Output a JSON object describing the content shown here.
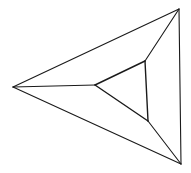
{
  "diagram": {
    "type": "graph",
    "stroke_color": "#1a1a1a",
    "background": "#ffffff",
    "vertices": {
      "outer_left": [
        13,
        87
      ],
      "outer_top": [
        179,
        9
      ],
      "outer_bottom": [
        181,
        164
      ],
      "inner_left": [
        95,
        85
      ],
      "inner_top": [
        145,
        61
      ],
      "inner_bottom": [
        148,
        121
      ]
    },
    "edges": [
      {
        "id": "outer-left-top",
        "from": "outer_left",
        "to": "outer_top",
        "kind": "outer"
      },
      {
        "id": "outer-top-bottom",
        "from": "outer_top",
        "to": "outer_bottom",
        "kind": "outer"
      },
      {
        "id": "outer-bottom-left",
        "from": "outer_bottom",
        "to": "outer_left",
        "kind": "outer"
      },
      {
        "id": "inner-left-top",
        "from": "inner_left",
        "to": "inner_top",
        "kind": "inner"
      },
      {
        "id": "inner-top-bottom",
        "from": "inner_top",
        "to": "inner_bottom",
        "kind": "inner"
      },
      {
        "id": "inner-bottom-left",
        "from": "inner_bottom",
        "to": "inner_left",
        "kind": "inner"
      },
      {
        "id": "spoke-left",
        "from": "outer_left",
        "to": "inner_left",
        "kind": "spoke"
      },
      {
        "id": "spoke-top",
        "from": "outer_top",
        "to": "inner_top",
        "kind": "spoke"
      },
      {
        "id": "spoke-bottom",
        "from": "outer_bottom",
        "to": "inner_bottom",
        "kind": "spoke"
      }
    ]
  }
}
